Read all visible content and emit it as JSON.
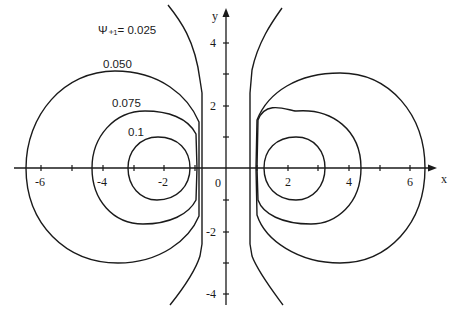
{
  "figure": {
    "x_axis_label": "x",
    "y_axis_label": "y",
    "x_ticks": [
      {
        "value": -6,
        "label": "-6"
      },
      {
        "value": -4,
        "label": "-4"
      },
      {
        "value": -2,
        "label": "-2"
      },
      {
        "value": 0,
        "label": "0"
      },
      {
        "value": 2,
        "label": "2"
      },
      {
        "value": 4,
        "label": "4"
      },
      {
        "value": 6,
        "label": "6"
      }
    ],
    "y_ticks": [
      {
        "value": 4,
        "label": "4"
      },
      {
        "value": 2,
        "label": "2"
      },
      {
        "value": -2,
        "label": "-2"
      },
      {
        "value": -4,
        "label": "-4"
      }
    ],
    "contour_labels": {
      "c1": "Ψ₊₁= 0.025",
      "c2": "0.050",
      "c3": "0.075",
      "c4": "0.1"
    },
    "contours": [
      {
        "level": 0.025,
        "label": "Ψ*1 = 0.025",
        "shape": "open curve, nearly vertical near x=±0.8, flaring outward at |y|>2.5"
      },
      {
        "level": 0.05,
        "label": "0.050",
        "shape": "closed loop, x from 0.8 to 6.5, y from -3.2 to 3.2"
      },
      {
        "level": 0.075,
        "label": "0.075",
        "shape": "closed loop, x from 0.9 to 4.4, y from -1.8 to 1.8"
      },
      {
        "level": 0.1,
        "label": "0.1",
        "shape": "closed loop, x from 1.2 to 3.2, y from -1.0 to 1.0"
      }
    ],
    "symmetry": "mirror symmetric about the y-axis",
    "line_color": "#1a1a1a",
    "background": "#ffffff"
  }
}
